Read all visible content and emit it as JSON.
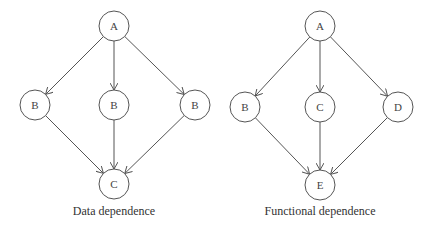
{
  "diagrams": [
    {
      "caption": "Data dependence",
      "nodes": [
        {
          "id": "n1",
          "label": "A",
          "x": 114,
          "y": 26
        },
        {
          "id": "n2",
          "label": "B",
          "x": 35,
          "y": 105
        },
        {
          "id": "n3",
          "label": "B",
          "x": 114,
          "y": 105
        },
        {
          "id": "n4",
          "label": "B",
          "x": 195,
          "y": 105
        },
        {
          "id": "n5",
          "label": "C",
          "x": 114,
          "y": 184
        }
      ],
      "edges": [
        [
          "n1",
          "n2"
        ],
        [
          "n1",
          "n3"
        ],
        [
          "n1",
          "n4"
        ],
        [
          "n2",
          "n5"
        ],
        [
          "n3",
          "n5"
        ],
        [
          "n4",
          "n5"
        ]
      ]
    },
    {
      "caption": "Functional dependence",
      "nodes": [
        {
          "id": "m1",
          "label": "A",
          "x": 320,
          "y": 26
        },
        {
          "id": "m2",
          "label": "B",
          "x": 245,
          "y": 107
        },
        {
          "id": "m3",
          "label": "C",
          "x": 320,
          "y": 107
        },
        {
          "id": "m4",
          "label": "D",
          "x": 398,
          "y": 107
        },
        {
          "id": "m5",
          "label": "E",
          "x": 320,
          "y": 185
        }
      ],
      "edges": [
        [
          "m1",
          "m2"
        ],
        [
          "m1",
          "m3"
        ],
        [
          "m1",
          "m4"
        ],
        [
          "m2",
          "m5"
        ],
        [
          "m3",
          "m5"
        ],
        [
          "m4",
          "m5"
        ]
      ]
    }
  ],
  "style": {
    "stroke": "#555555",
    "radius": 15
  }
}
